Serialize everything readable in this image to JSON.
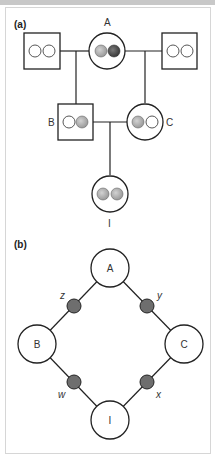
{
  "panel_a": {
    "label": "(a)",
    "individuals": {
      "A": {
        "label": "A",
        "sex": "female",
        "alleles": [
          "light",
          "dark"
        ]
      },
      "A_left_mate": {
        "label": "",
        "sex": "male",
        "alleles": [
          "empty",
          "empty"
        ]
      },
      "A_right_mate": {
        "label": "",
        "sex": "male",
        "alleles": [
          "empty",
          "empty"
        ]
      },
      "B": {
        "label": "B",
        "sex": "male",
        "alleles": [
          "empty",
          "light"
        ]
      },
      "C": {
        "label": "C",
        "sex": "female",
        "alleles": [
          "light",
          "empty"
        ]
      },
      "I": {
        "label": "I",
        "sex": "female",
        "alleles": [
          "light",
          "light"
        ]
      }
    }
  },
  "panel_b": {
    "label": "(b)",
    "nodes": {
      "A": "A",
      "B": "B",
      "C": "C",
      "I": "I"
    },
    "path_labels": {
      "z": "z",
      "y": "y",
      "w": "w",
      "x": "x"
    }
  },
  "colors": {
    "stroke": "#222222",
    "allele_light": "#b5b5b5",
    "allele_dark": "#555555",
    "path_node": "#6e6e6e",
    "border": "#d6d6d6",
    "topbar": "#c8c8c8"
  }
}
